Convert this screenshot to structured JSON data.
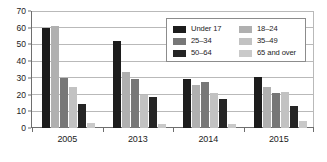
{
  "chart_data": {
    "type": "bar",
    "title": "",
    "xlabel": "",
    "ylabel": "",
    "ylim": [
      0,
      70
    ],
    "ytick_step": 10,
    "yticks": [
      0,
      10,
      20,
      30,
      40,
      50,
      60,
      70
    ],
    "ytick_labels": [
      "0",
      "10",
      "20",
      "30",
      "40",
      "50",
      "60",
      "70"
    ],
    "grid": true,
    "legend_position": "upper-right",
    "legend_columns": 2,
    "categories": [
      "2005",
      "2013",
      "2014",
      "2015"
    ],
    "series": [
      {
        "name": "Under 17",
        "color": "#1c1c1c",
        "values": [
          60.0,
          51.8,
          29.6,
          30.6
        ]
      },
      {
        "name": "18–24",
        "color": "#b0b0b0",
        "values": [
          61.0,
          33.5,
          26.0,
          24.4
        ]
      },
      {
        "name": "25–34",
        "color": "#777777",
        "values": [
          29.7,
          29.3,
          27.5,
          21.2
        ]
      },
      {
        "name": "35–49",
        "color": "#c2c2c2",
        "values": [
          24.5,
          20.0,
          20.8,
          21.5
        ]
      },
      {
        "name": "50–64",
        "color": "#252525",
        "values": [
          14.6,
          18.3,
          17.4,
          13.4
        ]
      },
      {
        "name": "65 and over",
        "color": "#c9c9c9",
        "values": [
          3.1,
          2.3,
          2.7,
          4.4
        ]
      }
    ]
  },
  "legend": {
    "items": [
      {
        "label": "Under 17",
        "color": "#1c1c1c"
      },
      {
        "label": "18–24",
        "color": "#b0b0b0"
      },
      {
        "label": "25–34",
        "color": "#777777"
      },
      {
        "label": "35–49",
        "color": "#c2c2c2"
      },
      {
        "label": "50–64",
        "color": "#252525"
      },
      {
        "label": "65 and over",
        "color": "#c9c9c9"
      }
    ]
  },
  "colors": {
    "axis": "#6e6e6e",
    "gridline": "#b9b9b9",
    "text": "#1b1b1b",
    "background": "#ffffff",
    "legend_border": "#8c8c8c"
  }
}
